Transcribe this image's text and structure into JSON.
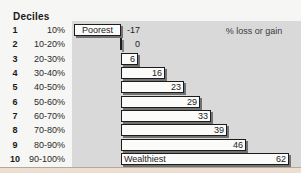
{
  "header": {
    "title": "Deciles"
  },
  "chart_data": {
    "type": "bar",
    "orientation": "horizontal",
    "title": "Deciles",
    "value_label": "% loss or gain",
    "xlim": [
      -17,
      62
    ],
    "grid": false,
    "legend": false,
    "categories": [
      "10%",
      "10-20%",
      "20-30%",
      "30-40%",
      "40-50%",
      "50-60%",
      "60-70%",
      "70-80%",
      "80-90%",
      "90-100%"
    ],
    "values": [
      -17,
      0,
      6,
      16,
      23,
      29,
      33,
      39,
      46,
      62
    ],
    "rows": [
      {
        "decile": "1",
        "range": "10%",
        "value": -17,
        "label": "-17",
        "label_position": "outside",
        "bar_text": "Poorest"
      },
      {
        "decile": "2",
        "range": "10-20%",
        "value": 0,
        "label": "0",
        "label_position": "outside",
        "bar_text": null
      },
      {
        "decile": "3",
        "range": "20-30%",
        "value": 6,
        "label": "6",
        "label_position": "inside",
        "bar_text": null
      },
      {
        "decile": "4",
        "range": "30-40%",
        "value": 16,
        "label": "16",
        "label_position": "inside",
        "bar_text": null
      },
      {
        "decile": "5",
        "range": "40-50%",
        "value": 23,
        "label": "23",
        "label_position": "inside",
        "bar_text": null
      },
      {
        "decile": "6",
        "range": "50-60%",
        "value": 29,
        "label": "29",
        "label_position": "inside",
        "bar_text": null
      },
      {
        "decile": "7",
        "range": "60-70%",
        "value": 33,
        "label": "33",
        "label_position": "inside",
        "bar_text": null
      },
      {
        "decile": "8",
        "range": "70-80%",
        "value": 39,
        "label": "39",
        "label_position": "inside",
        "bar_text": null
      },
      {
        "decile": "9",
        "range": "80-90%",
        "value": 46,
        "label": "46",
        "label_position": "inside",
        "bar_text": null
      },
      {
        "decile": "10",
        "range": "90-100%",
        "value": 62,
        "label": "62",
        "label_position": "inside",
        "bar_text": "Wealthiest"
      }
    ]
  },
  "colors": {
    "page_bg": "#f6f6f5",
    "panel_bg": "#d9d9d9",
    "bar_fill": "#fbfbfa",
    "bar_border": "#1c1c1c",
    "text": "#1a1a1a",
    "bottom_strip": "#ecdfd2"
  }
}
